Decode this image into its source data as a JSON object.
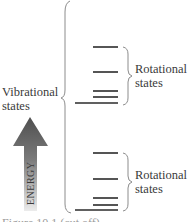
{
  "diagram": {
    "type": "energy-level-diagram",
    "labels": {
      "vibrational_line1": "Vibrational",
      "vibrational_line2": "states",
      "rotational_upper_line1": "Rotational",
      "rotational_upper_line2": "states",
      "rotational_lower_line1": "Rotational",
      "rotational_lower_line2": "states",
      "axis": "ENERGY"
    },
    "vibrational_levels": [
      {
        "name": "upper-vibrational-level",
        "rotational_levels_y": [
          47,
          72,
          91,
          97
        ],
        "base_y": 103
      },
      {
        "name": "lower-vibrational-level",
        "rotational_levels_y": [
          153,
          179,
          198,
          205
        ],
        "base_y": 210
      }
    ],
    "colors": {
      "line": "#2b2b2b",
      "brace": "#8c8c8c",
      "arrow_top": "#555555",
      "arrow_bottom": "#e6e6e6"
    },
    "caption": "Figure 10.1  (cut off)"
  }
}
